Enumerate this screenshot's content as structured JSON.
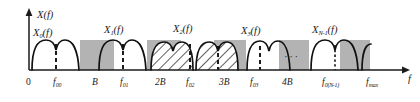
{
  "figure": {
    "type": "spectrum-diagram",
    "axes": {
      "y_label_main": "X",
      "y_label_arg": "(f)",
      "x_label": "f",
      "origin_label": "0"
    },
    "curve_labels": [
      {
        "id": "x0",
        "base": "X",
        "sub": "0",
        "arg": "(f)",
        "x": 33,
        "y": 28
      },
      {
        "id": "x1",
        "base": "X",
        "sub": "1",
        "arg": "(f)",
        "x": 104,
        "y": 25
      },
      {
        "id": "x2",
        "base": "X",
        "sub": "2",
        "arg": "(f)",
        "x": 173,
        "y": 24
      },
      {
        "id": "x3",
        "base": "X",
        "sub": "3",
        "arg": "(f)",
        "x": 241,
        "y": 26
      },
      {
        "id": "xn",
        "base": "X",
        "sub": "N-1",
        "arg": "(f)",
        "x": 318,
        "y": 25
      }
    ],
    "x_ticks": [
      {
        "id": "zero",
        "base": "0",
        "sub": "",
        "x": 29,
        "dashed": false
      },
      {
        "id": "f00",
        "base": "f",
        "sub": "00",
        "x": 61,
        "dashed": true
      },
      {
        "id": "B",
        "base": "B",
        "sub": "",
        "x": 96,
        "dashed": false
      },
      {
        "id": "f01",
        "base": "f",
        "sub": "01",
        "x": 128,
        "dashed": true
      },
      {
        "id": "2B",
        "base": "2B",
        "sub": "",
        "x": 161,
        "dashed": false
      },
      {
        "id": "f02",
        "base": "f",
        "sub": "02",
        "x": 192,
        "dashed": true
      },
      {
        "id": "3B",
        "base": "3B",
        "sub": "",
        "x": 225,
        "dashed": false
      },
      {
        "id": "f03",
        "base": "f",
        "sub": "03",
        "x": 256,
        "dashed": true
      },
      {
        "id": "4B",
        "base": "4B",
        "sub": "",
        "x": 288,
        "dashed": false
      },
      {
        "id": "f0N1",
        "base": "f",
        "sub": "0(N-1)",
        "x": 350,
        "dashed": true
      },
      {
        "id": "fmax",
        "base": "f",
        "sub": "max",
        "x": 387,
        "dashed": false
      }
    ],
    "ellipsis": {
      "text": "···",
      "x": 284,
      "y": 56
    },
    "colors": {
      "curve": "#111111",
      "axis": "#1a1a1a",
      "band_gray": "#b3b3b3",
      "hatch": "#2a2a2a",
      "text": "#1a1a1a",
      "background": "#ffffff"
    },
    "bands": {
      "gray_top_y": 40,
      "baseline_y": 70,
      "description": "shaded guard bands between adjacent sub-band spectra"
    }
  }
}
